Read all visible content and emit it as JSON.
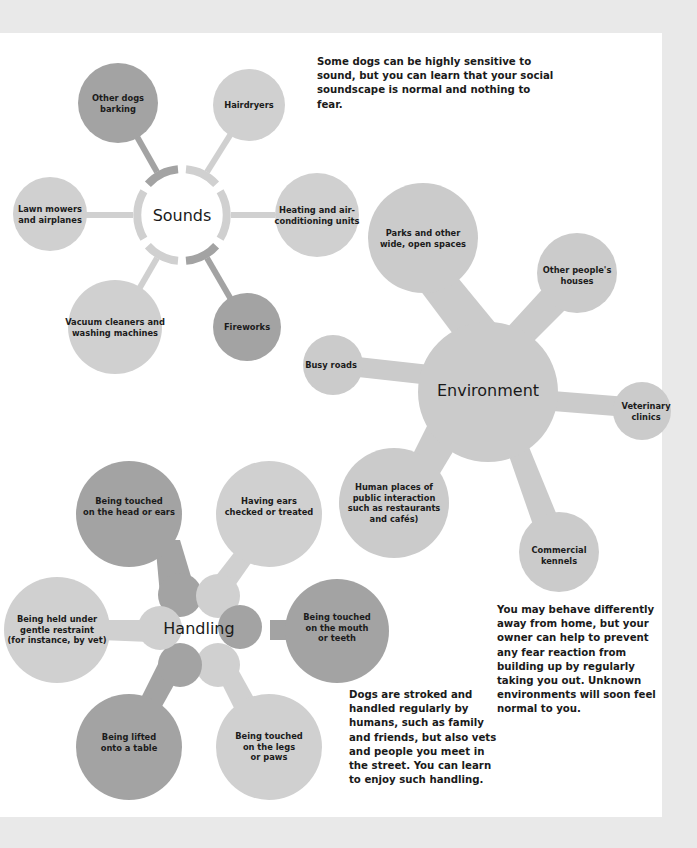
{
  "colors": {
    "background": "#e9e9e9",
    "page": "#ffffff",
    "dark": "#a3a3a3",
    "medium": "#bcbcbc",
    "light": "#d0d0d0",
    "text": "#1a1a1a"
  },
  "sounds": {
    "hub_label": "Sounds",
    "caption": "Some dogs can be highly sensitive to sound, but you can learn that your social soundscape is normal and nothing to fear.",
    "nodes": [
      {
        "label": "Other dogs\nbarking",
        "tone": "dark"
      },
      {
        "label": "Hairdryers",
        "tone": "light"
      },
      {
        "label": "Heating and air-\nconditioning units",
        "tone": "light"
      },
      {
        "label": "Fireworks",
        "tone": "dark"
      },
      {
        "label": "Vacuum cleaners and\nwashing machines",
        "tone": "light"
      },
      {
        "label": "Lawn mowers\nand airplanes",
        "tone": "light"
      }
    ]
  },
  "environment": {
    "hub_label": "Environment",
    "caption": "You may behave differently away from home, but your owner can help to prevent any fear reaction from building up by regularly taking you out. Unknown environments will soon feel normal to you.",
    "nodes": [
      {
        "label": "Parks and other\nwide, open spaces"
      },
      {
        "label": "Other people's\nhouses"
      },
      {
        "label": "Veterinary\nclinics"
      },
      {
        "label": "Commercial\nkennels"
      },
      {
        "label": "Human places of\npublic interaction\nsuch as restaurants\nand cafés)"
      },
      {
        "label": "Busy roads"
      }
    ]
  },
  "handling": {
    "hub_label": "Handling",
    "caption": "Dogs are stroked and handled regularly by humans, such as family and friends, but also vets and people you meet in the street. You can learn to enjoy such handling.",
    "nodes": [
      {
        "label": "Being touched\non the head or ears",
        "tone": "dark"
      },
      {
        "label": "Having ears\nchecked or treated",
        "tone": "light"
      },
      {
        "label": "Being touched\non the mouth\nor teeth",
        "tone": "dark"
      },
      {
        "label": "Being touched\non the legs\nor paws",
        "tone": "light"
      },
      {
        "label": "Being lifted\nonto a table",
        "tone": "dark"
      },
      {
        "label": "Being held under\ngentle restraint\n(for instance, by vet)",
        "tone": "light"
      }
    ]
  }
}
